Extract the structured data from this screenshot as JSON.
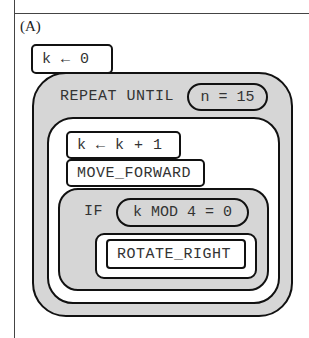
{
  "option_label": "(A)",
  "blocks": {
    "init": "k ← 0",
    "repeat_keyword": "REPEAT UNTIL",
    "repeat_condition": "n = 15",
    "increment": "k ← k + 1",
    "move": "MOVE_FORWARD",
    "if_keyword": "IF",
    "if_condition": "k MOD 4 = 0",
    "rotate": "ROTATE_RIGHT"
  }
}
